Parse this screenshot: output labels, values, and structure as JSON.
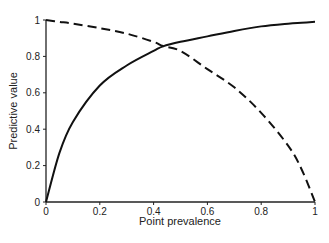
{
  "chart_data": {
    "type": "line",
    "title": "",
    "xlabel": "Point prevalence",
    "ylabel": "Predictive value",
    "xlim": [
      0,
      1
    ],
    "ylim": [
      0,
      1
    ],
    "grid": false,
    "legend": null,
    "x_ticks": [
      "0",
      "0.2",
      "0.4",
      "0.6",
      "0.8",
      "1"
    ],
    "y_ticks": [
      "0",
      "0.2",
      "0.4",
      "0.6",
      "0.8",
      "1"
    ],
    "x": [
      0,
      0.05,
      0.1,
      0.2,
      0.3,
      0.4,
      0.435,
      0.5,
      0.6,
      0.7,
      0.8,
      0.9,
      0.95,
      1.0
    ],
    "series": [
      {
        "name": "Positive predictive value",
        "style": "solid",
        "values": [
          0,
          0.27,
          0.44,
          0.64,
          0.75,
          0.83,
          0.855,
          0.88,
          0.91,
          0.94,
          0.965,
          0.98,
          0.985,
          0.99
        ]
      },
      {
        "name": "Negative predictive value",
        "style": "dashed",
        "values": [
          1.0,
          0.99,
          0.98,
          0.955,
          0.925,
          0.88,
          0.857,
          0.83,
          0.73,
          0.63,
          0.49,
          0.31,
          0.18,
          0
        ]
      }
    ]
  },
  "axes": {
    "xlabel": "Point prevalence",
    "ylabel": "Predictive value"
  }
}
